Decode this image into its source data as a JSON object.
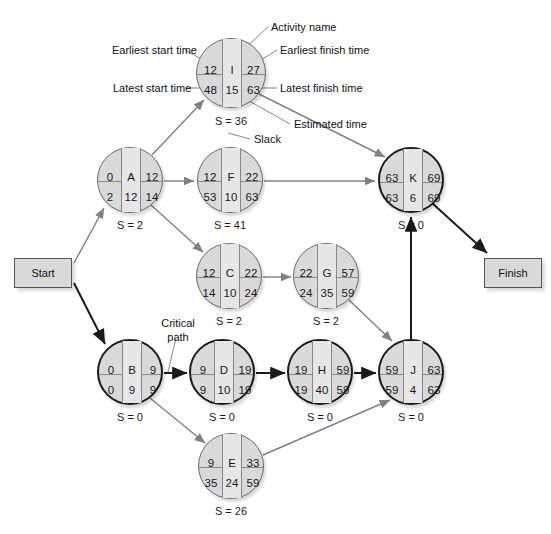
{
  "diagram": {
    "type": "activity-on-node-network",
    "colors": {
      "node_fill": "#d9d9d9",
      "node_center_fill": "#e6e6e6",
      "node_border": "#6b6b6b",
      "critical_border": "#1a1a1a",
      "edge": "#808080",
      "critical_edge": "#1a1a1a",
      "text": "#1a1a1a",
      "background": "#ffffff"
    }
  },
  "terminals": {
    "start": {
      "label": "Start",
      "x": 14,
      "y": 258,
      "w": 58,
      "h": 30
    },
    "finish": {
      "label": "Finish",
      "x": 484,
      "y": 258,
      "w": 58,
      "h": 30
    }
  },
  "legend": {
    "earliest_start_time": "Earliest start time",
    "activity_name": "Activity name",
    "earliest_finish_time": "Earliest finish time",
    "latest_start_time": "Latest start time",
    "latest_finish_time": "Latest finish time",
    "estimated_time": "Estimated time",
    "slack": "Slack",
    "critical_path": "Critical\npath",
    "critical_path_line1": "Critical",
    "critical_path_line2": "path"
  },
  "nodes": [
    {
      "id": "I",
      "name": "I",
      "earliest_start": "12",
      "earliest_finish": "27",
      "latest_start": "48",
      "estimated_time": "15",
      "latest_finish": "63",
      "slack_label": "S = 36",
      "slack_value": 36,
      "cx": 231,
      "cy": 73,
      "r": 35,
      "critical": false
    },
    {
      "id": "A",
      "name": "A",
      "earliest_start": "0",
      "earliest_finish": "12",
      "latest_start": "2",
      "estimated_time": "12",
      "latest_finish": "14",
      "slack_label": "S = 2",
      "slack_value": 2,
      "cx": 130,
      "cy": 180,
      "r": 33,
      "critical": false
    },
    {
      "id": "F",
      "name": "F",
      "earliest_start": "12",
      "earliest_finish": "22",
      "latest_start": "53",
      "estimated_time": "10",
      "latest_finish": "63",
      "slack_label": "S = 41",
      "slack_value": 41,
      "cx": 230,
      "cy": 180,
      "r": 33,
      "critical": false
    },
    {
      "id": "K",
      "name": "K",
      "earliest_start": "63",
      "earliest_finish": "69",
      "latest_start": "63",
      "estimated_time": "6",
      "latest_finish": "69",
      "slack_label": "S = 0",
      "slack_value": 0,
      "cx": 411,
      "cy": 180,
      "r": 33,
      "critical": true
    },
    {
      "id": "C",
      "name": "C",
      "earliest_start": "12",
      "earliest_finish": "22",
      "latest_start": "14",
      "estimated_time": "10",
      "latest_finish": "24",
      "slack_label": "S = 2",
      "slack_value": 2,
      "cx": 229,
      "cy": 276,
      "r": 33,
      "critical": false
    },
    {
      "id": "G",
      "name": "G",
      "earliest_start": "22",
      "earliest_finish": "57",
      "latest_start": "24",
      "estimated_time": "35",
      "latest_finish": "59",
      "slack_label": "S = 2",
      "slack_value": 2,
      "cx": 326,
      "cy": 276,
      "r": 33,
      "critical": false
    },
    {
      "id": "B",
      "name": "B",
      "earliest_start": "0",
      "earliest_finish": "9",
      "latest_start": "0",
      "estimated_time": "9",
      "latest_finish": "9",
      "slack_label": "S = 0",
      "slack_value": 0,
      "cx": 130,
      "cy": 372,
      "r": 33,
      "critical": true
    },
    {
      "id": "D",
      "name": "D",
      "earliest_start": "9",
      "earliest_finish": "19",
      "latest_start": "9",
      "estimated_time": "10",
      "latest_finish": "19",
      "slack_label": "S = 0",
      "slack_value": 0,
      "cx": 222,
      "cy": 372,
      "r": 33,
      "critical": true
    },
    {
      "id": "H",
      "name": "H",
      "earliest_start": "19",
      "earliest_finish": "59",
      "latest_start": "19",
      "estimated_time": "40",
      "latest_finish": "59",
      "slack_label": "S = 0",
      "slack_value": 0,
      "cx": 320,
      "cy": 372,
      "r": 33,
      "critical": true
    },
    {
      "id": "J",
      "name": "J",
      "earliest_start": "59",
      "earliest_finish": "63",
      "latest_start": "59",
      "estimated_time": "4",
      "latest_finish": "63",
      "slack_label": "S = 0",
      "slack_value": 0,
      "cx": 411,
      "cy": 372,
      "r": 33,
      "critical": true
    },
    {
      "id": "E",
      "name": "E",
      "earliest_start": "9",
      "earliest_finish": "33",
      "latest_start": "35",
      "estimated_time": "24",
      "latest_finish": "59",
      "slack_label": "S = 26",
      "slack_value": 26,
      "cx": 231,
      "cy": 466,
      "r": 33,
      "critical": false
    }
  ],
  "edges": [
    {
      "from": "Start",
      "to": "A",
      "critical": false
    },
    {
      "from": "Start",
      "to": "B",
      "critical": true
    },
    {
      "from": "A",
      "to": "I",
      "critical": false
    },
    {
      "from": "A",
      "to": "F",
      "critical": false
    },
    {
      "from": "A",
      "to": "C",
      "critical": false
    },
    {
      "from": "I",
      "to": "K",
      "critical": false
    },
    {
      "from": "F",
      "to": "K",
      "critical": false
    },
    {
      "from": "C",
      "to": "G",
      "critical": false
    },
    {
      "from": "G",
      "to": "J",
      "critical": false
    },
    {
      "from": "B",
      "to": "D",
      "critical": true
    },
    {
      "from": "B",
      "to": "E",
      "critical": false
    },
    {
      "from": "D",
      "to": "H",
      "critical": true
    },
    {
      "from": "H",
      "to": "J",
      "critical": true
    },
    {
      "from": "E",
      "to": "J",
      "critical": false
    },
    {
      "from": "J",
      "to": "K",
      "critical": true
    },
    {
      "from": "K",
      "to": "Finish",
      "critical": true
    }
  ]
}
